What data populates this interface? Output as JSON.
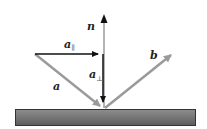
{
  "diagram": {
    "title": "",
    "labels": {
      "normal": "n",
      "incident": "a",
      "reflected": "b",
      "parallel": "a",
      "parallel_sub": "∥",
      "perpendicular": "a",
      "perpendicular_sub": "⊥"
    },
    "colors": {
      "black_arrow": "#111111",
      "gray_arrow": "#9a9a9a",
      "surface_top": "#8a8a8a",
      "surface_bottom": "#5e5e5e",
      "surface_border": "#333333"
    }
  }
}
